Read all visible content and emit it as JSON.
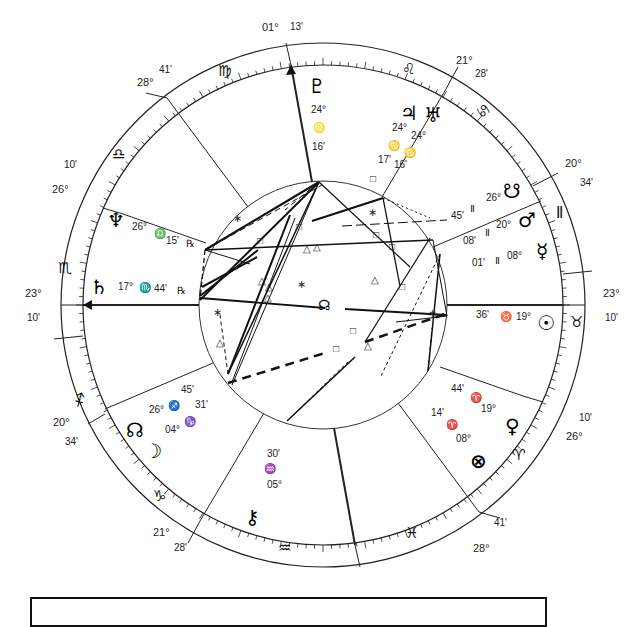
{
  "chart_data": {
    "type": "natal-chart-wheel",
    "center": [
      323,
      305
    ],
    "house_cusps": [
      {
        "house": "ASC",
        "position_deg": 23,
        "position_min": 10,
        "sign": "Scorpio"
      },
      {
        "house": "2",
        "position_deg": 20,
        "position_min": 34,
        "sign": "Sagittarius"
      },
      {
        "house": "3",
        "position_deg": 21,
        "position_min": 28,
        "sign": "Capricorn"
      },
      {
        "house": "IC",
        "position_deg": 1,
        "position_min": 13,
        "sign": "Pisces"
      },
      {
        "house": "5",
        "position_deg": 28,
        "position_min": 41,
        "sign": "Pisces"
      },
      {
        "house": "6",
        "position_deg": 26,
        "position_min": 10,
        "sign": "Aries"
      },
      {
        "house": "DSC",
        "position_deg": 23,
        "position_min": 10,
        "sign": "Taurus"
      },
      {
        "house": "8",
        "position_deg": 20,
        "position_min": 34,
        "sign": "Gemini"
      },
      {
        "house": "9",
        "position_deg": 21,
        "position_min": 28,
        "sign": "Cancer"
      },
      {
        "house": "MC",
        "position_deg": 1,
        "position_min": 13,
        "sign": "Virgo"
      },
      {
        "house": "11",
        "position_deg": 28,
        "position_min": 41,
        "sign": "Virgo"
      },
      {
        "house": "12",
        "position_deg": 26,
        "position_min": 10,
        "sign": "Libra"
      }
    ],
    "planets": [
      {
        "name": "Pluto",
        "glyph": "♇",
        "deg": "24°",
        "sign_glyph": "♌",
        "min": "16'"
      },
      {
        "name": "Jupiter",
        "glyph": "♃",
        "deg": "24°",
        "sign_glyph": "♋",
        "min": "17'"
      },
      {
        "name": "Uranus",
        "glyph": "♅",
        "deg": "24°",
        "sign_glyph": "♋",
        "min": "16'"
      },
      {
        "name": "South Node",
        "glyph": "☋",
        "deg": "26°",
        "sign_glyph": "♊",
        "min": "45'"
      },
      {
        "name": "Mars",
        "glyph": "♂",
        "deg": "20°",
        "sign_glyph": "♊",
        "min": "08'"
      },
      {
        "name": "Mercury",
        "glyph": "☿",
        "deg": "08°",
        "sign_glyph": "♊",
        "min": "01'"
      },
      {
        "name": "Sun",
        "glyph": "☉",
        "deg": "19°",
        "sign_glyph": "♉",
        "min": "36'"
      },
      {
        "name": "Venus",
        "glyph": "♀",
        "deg": "19°",
        "sign_glyph": "♈",
        "min": "44'"
      },
      {
        "name": "Part of Fortune",
        "glyph": "⊗",
        "deg": "08°",
        "sign_glyph": "♈",
        "min": "14'"
      },
      {
        "name": "Chiron",
        "glyph": "⚷",
        "deg": "05°",
        "sign_glyph": "♒",
        "min": "30'"
      },
      {
        "name": "North Node",
        "glyph": "☊",
        "deg": "26°",
        "sign_glyph": "♐",
        "min": "45'"
      },
      {
        "name": "Moon",
        "glyph": "☽",
        "deg": "04°",
        "sign_glyph": "♑",
        "min": "31'"
      },
      {
        "name": "Saturn",
        "glyph": "♄",
        "deg": "17°",
        "sign_glyph": "♏",
        "min": "44'",
        "retrograde": "℞"
      },
      {
        "name": "Neptune",
        "glyph": "♆",
        "deg": "26°",
        "sign_glyph": "♎",
        "min": "15'",
        "retrograde": "℞"
      }
    ],
    "signs": [
      "♈",
      "♉",
      "♊",
      "♋",
      "♌",
      "♍",
      "♎",
      "♏",
      "♐",
      "♑",
      "♒",
      "♓"
    ]
  },
  "cusps_labels": {
    "mc_deg": "01°",
    "mc_min": "13'",
    "ic_deg": "01°",
    "ic_min": "13'",
    "asc_deg": "23°",
    "asc_min": "10'",
    "dsc_deg": "23°",
    "dsc_min": "10'",
    "h11_deg": "28°",
    "h11_min": "41'",
    "h5_deg": "28°",
    "h5_min": "41'",
    "h9_deg": "21°",
    "h9_min": "28'",
    "h3_deg": "21°",
    "h3_min": "28'",
    "h8_deg": "20°",
    "h8_min": "34'",
    "h2_deg": "20°",
    "h2_min": "34'",
    "h12_deg": "26°",
    "h12_min": "10'",
    "h6_deg": "26°",
    "h6_min": "10'"
  },
  "signs": {
    "aries": "♈",
    "taurus": "♉",
    "gemini": "Ⅱ",
    "cancer": "♋",
    "leo": "♌",
    "virgo": "♍",
    "libra": "♎",
    "scorpio": "♏",
    "sagittarius": "♐",
    "capricorn": "♑",
    "aquarius": "♒",
    "pisces": "♓"
  },
  "planets": {
    "pluto": {
      "glyph": "♇",
      "deg": "24°",
      "sign": "♌",
      "min": "16'"
    },
    "jupiter": {
      "glyph": "♃",
      "deg": "24°",
      "sign": "♋",
      "min": "17'"
    },
    "uranus": {
      "glyph": "♅",
      "deg": "24°",
      "sign": "♋",
      "min": "16'"
    },
    "south_node": {
      "glyph": "☋",
      "deg": "26°",
      "sign": "Ⅱ",
      "min": "45'"
    },
    "mars": {
      "glyph": "♂",
      "deg": "20°",
      "sign": "Ⅱ",
      "min": "08'"
    },
    "mercury": {
      "glyph": "☿",
      "deg": "08°",
      "sign": "Ⅱ",
      "min": "01'"
    },
    "sun": {
      "glyph": "☉",
      "deg": "19°",
      "sign": "♉",
      "min": "36'"
    },
    "venus": {
      "glyph": "♀",
      "deg": "19°",
      "sign": "♈",
      "min": "44'"
    },
    "fortune": {
      "glyph": "⊗",
      "deg": "08°",
      "sign": "♈",
      "min": "14'"
    },
    "chiron": {
      "glyph": "⚷",
      "deg": "05°",
      "sign": "♒",
      "min": "30'"
    },
    "north_node": {
      "glyph": "☊",
      "deg": "26°",
      "sign": "♐",
      "min": "45'"
    },
    "moon": {
      "glyph": "☽",
      "deg": "04°",
      "sign": "♑",
      "min": "31'"
    },
    "saturn": {
      "glyph": "♄",
      "deg": "17°",
      "sign": "♏",
      "min": "44'",
      "retro": "℞"
    },
    "neptune": {
      "glyph": "♆",
      "deg": "26°",
      "sign": "♎",
      "min": "15'",
      "retro": "℞"
    }
  },
  "center_glyph": "☊"
}
